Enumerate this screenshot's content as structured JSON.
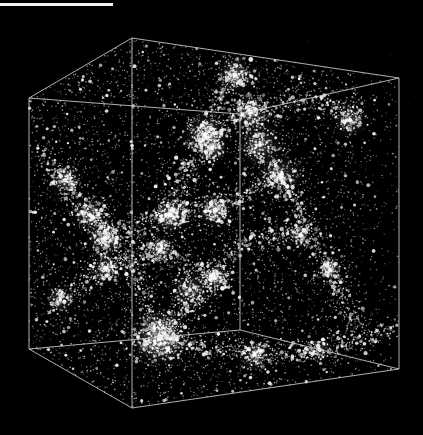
{
  "image": {
    "width": 423,
    "height": 435,
    "background": "#000000",
    "description": "3D simulation cube of cosmic web large-scale structure"
  },
  "scale_bar": {
    "x": 0,
    "y": 3,
    "length_px": 113,
    "thickness_px": 3,
    "color": "#f2f2f2",
    "label": ""
  },
  "cube": {
    "edge_color": "#cfcfcf",
    "edge_width": 1,
    "vertices": {
      "top_front_left": [
        29,
        98
      ],
      "top_back_left": [
        132,
        38
      ],
      "top_back_right": [
        399,
        78
      ],
      "top_front_mid": [
        240,
        114
      ],
      "bottom_front_left": [
        29,
        349
      ],
      "bottom_back_left": [
        132,
        408
      ],
      "bottom_back_right": [
        399,
        369
      ],
      "bottom_front_mid": [
        240,
        330
      ],
      "back_inner_bottom": [
        132,
        338
      ]
    },
    "edges": [
      [
        "top_front_left",
        "top_back_left"
      ],
      [
        "top_back_left",
        "top_back_right"
      ],
      [
        "top_front_left",
        "top_front_mid"
      ],
      [
        "top_front_mid",
        "top_back_right"
      ],
      [
        "top_back_right",
        "bottom_back_right"
      ],
      [
        "top_front_left",
        "bottom_front_left"
      ],
      [
        "top_front_mid",
        "bottom_front_mid"
      ],
      [
        "top_back_left",
        "bottom_back_left"
      ],
      [
        "bottom_front_left",
        "bottom_back_left"
      ],
      [
        "bottom_back_left",
        "bottom_back_right"
      ],
      [
        "bottom_front_left",
        "bottom_front_mid"
      ],
      [
        "bottom_front_mid",
        "bottom_back_right"
      ]
    ]
  },
  "particles": {
    "color": "#ffffff",
    "background_count": 5200,
    "seed": 42,
    "clusters": [
      {
        "x": 160,
        "y": 338,
        "r": 22,
        "n": 420,
        "glow": 1.0
      },
      {
        "x": 235,
        "y": 75,
        "r": 14,
        "n": 160,
        "glow": 0.8
      },
      {
        "x": 250,
        "y": 112,
        "r": 14,
        "n": 180,
        "glow": 0.8
      },
      {
        "x": 205,
        "y": 135,
        "r": 16,
        "n": 200,
        "glow": 0.8
      },
      {
        "x": 212,
        "y": 148,
        "r": 12,
        "n": 120,
        "glow": 0.6
      },
      {
        "x": 170,
        "y": 215,
        "r": 14,
        "n": 180,
        "glow": 0.8
      },
      {
        "x": 215,
        "y": 210,
        "r": 14,
        "n": 160,
        "glow": 0.7
      },
      {
        "x": 160,
        "y": 250,
        "r": 12,
        "n": 120,
        "glow": 0.6
      },
      {
        "x": 105,
        "y": 238,
        "r": 14,
        "n": 170,
        "glow": 0.8
      },
      {
        "x": 90,
        "y": 215,
        "r": 14,
        "n": 140,
        "glow": 0.6
      },
      {
        "x": 65,
        "y": 180,
        "r": 12,
        "n": 110,
        "glow": 0.6
      },
      {
        "x": 105,
        "y": 268,
        "r": 12,
        "n": 110,
        "glow": 0.6
      },
      {
        "x": 215,
        "y": 278,
        "r": 12,
        "n": 120,
        "glow": 0.6
      },
      {
        "x": 280,
        "y": 175,
        "r": 16,
        "n": 160,
        "glow": 0.6
      },
      {
        "x": 260,
        "y": 145,
        "r": 18,
        "n": 200,
        "glow": 0.6
      },
      {
        "x": 300,
        "y": 235,
        "r": 10,
        "n": 80,
        "glow": 0.5
      },
      {
        "x": 330,
        "y": 270,
        "r": 10,
        "n": 80,
        "glow": 0.5
      },
      {
        "x": 320,
        "y": 350,
        "r": 10,
        "n": 70,
        "glow": 0.5
      },
      {
        "x": 255,
        "y": 355,
        "r": 14,
        "n": 110,
        "glow": 0.5
      },
      {
        "x": 350,
        "y": 120,
        "r": 14,
        "n": 110,
        "glow": 0.5
      },
      {
        "x": 190,
        "y": 290,
        "r": 16,
        "n": 140,
        "glow": 0.5
      },
      {
        "x": 60,
        "y": 300,
        "r": 12,
        "n": 80,
        "glow": 0.4
      }
    ],
    "filaments": [
      [
        [
          40,
          150
        ],
        [
          90,
          215
        ],
        [
          130,
          260
        ],
        [
          160,
          338
        ]
      ],
      [
        [
          160,
          338
        ],
        [
          215,
          278
        ],
        [
          240,
          240
        ],
        [
          300,
          235
        ]
      ],
      [
        [
          205,
          135
        ],
        [
          250,
          112
        ],
        [
          300,
          100
        ],
        [
          360,
          110
        ]
      ],
      [
        [
          170,
          215
        ],
        [
          205,
          135
        ],
        [
          235,
          75
        ]
      ],
      [
        [
          105,
          238
        ],
        [
          170,
          215
        ],
        [
          215,
          210
        ],
        [
          280,
          175
        ]
      ],
      [
        [
          160,
          338
        ],
        [
          255,
          355
        ],
        [
          320,
          350
        ],
        [
          390,
          330
        ]
      ],
      [
        [
          60,
          300
        ],
        [
          105,
          268
        ],
        [
          160,
          250
        ],
        [
          215,
          278
        ]
      ],
      [
        [
          280,
          175
        ],
        [
          330,
          270
        ],
        [
          360,
          330
        ]
      ]
    ]
  }
}
